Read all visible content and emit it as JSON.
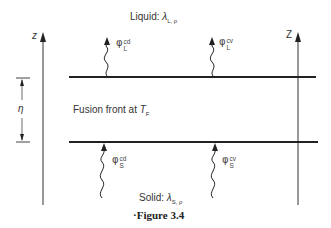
{
  "figure": {
    "caption": "·Figure 3.4",
    "liquid_label": {
      "text": "Liquid: ",
      "symbol": "λ",
      "subscript": "L, ρ"
    },
    "solid_label": {
      "text": "Solid: ",
      "symbol": "λ",
      "subscript": "S, ρ"
    },
    "front_label": {
      "text": "Fusion front at ",
      "symbol": "T",
      "subscript": "F"
    },
    "left_axis_label": "z",
    "right_axis_label": "Z",
    "gap_label": "η",
    "fluxes": [
      {
        "symbol": "φ",
        "sup": "cd",
        "sub": "L"
      },
      {
        "symbol": "φ",
        "sup": "cv",
        "sub": "L"
      },
      {
        "symbol": "φ",
        "sup": "cd",
        "sub": "S"
      },
      {
        "symbol": "φ",
        "sup": "cv",
        "sub": "S"
      }
    ]
  }
}
